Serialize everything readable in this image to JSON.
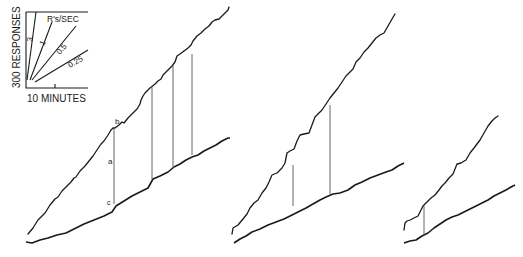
{
  "figure": {
    "key": {
      "y_label": "300 RESPONSES",
      "x_label": "10 MINUTES",
      "units_label": "R's/SEC",
      "rate_labels": [
        "3",
        "1",
        "0.5",
        "0.25"
      ]
    },
    "annotations": {
      "b": "b",
      "a": "a",
      "c": "c"
    },
    "panels": [
      {
        "name": "left-record",
        "verticals": 4
      },
      {
        "name": "middle-record",
        "verticals": 2
      },
      {
        "name": "right-record",
        "verticals": 1
      }
    ],
    "caption": "",
    "colors": {
      "ink": "#1a1a1a",
      "background": "#ffffff"
    }
  }
}
